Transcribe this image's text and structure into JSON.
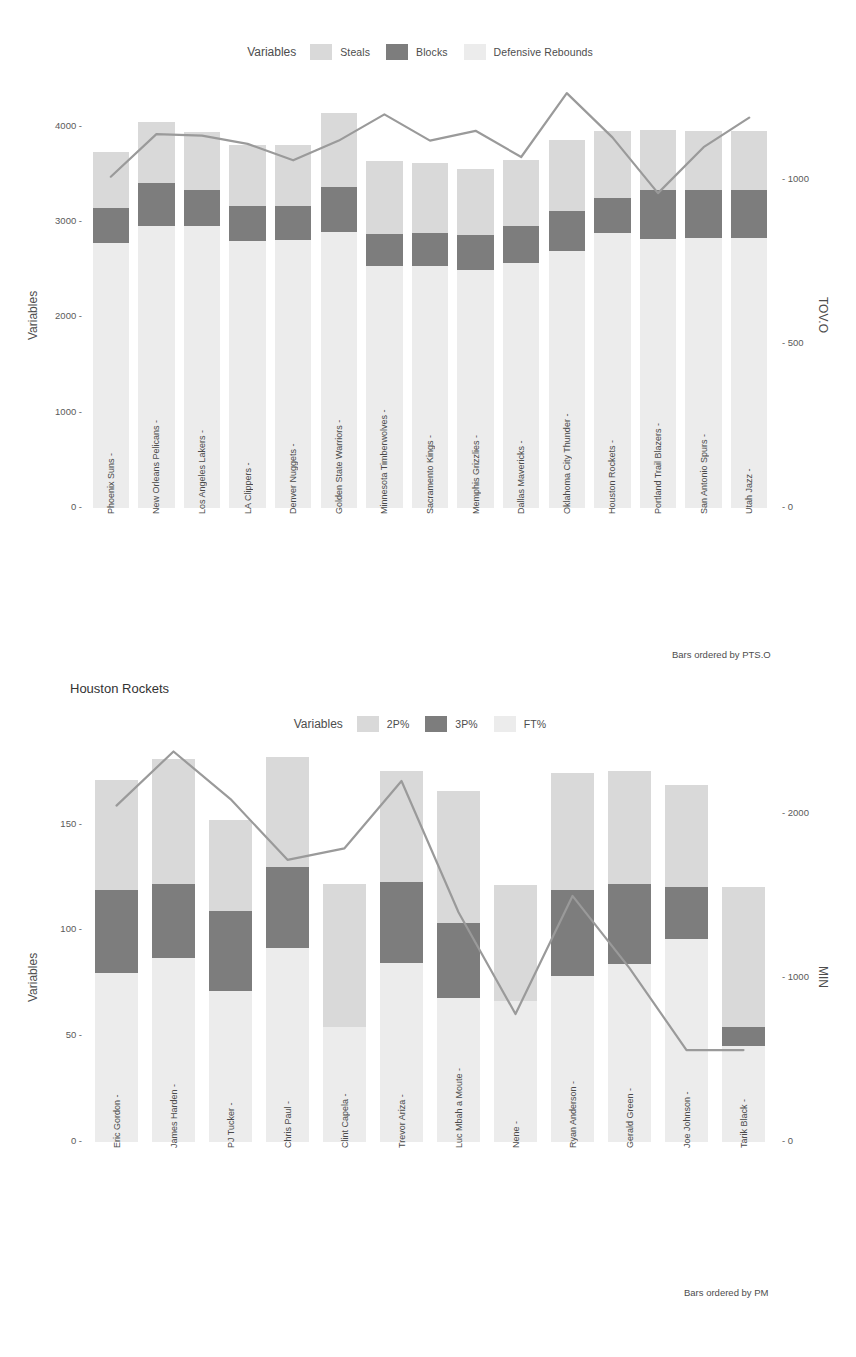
{
  "figure": {
    "background": "#ffffff",
    "colors": {
      "series_light": "#d9d9d9",
      "series_dark": "#7d7d7d",
      "series_pale": "#ececec",
      "line": "#9a9a9a",
      "text": "#4d4d4d"
    }
  },
  "panel1": {
    "legend": {
      "title": "Variables",
      "items": [
        {
          "label": "Steals",
          "color": "#d9d9d9",
          "swatch_name": "legend-swatch-steals"
        },
        {
          "label": "Blocks",
          "color": "#7d7d7d",
          "swatch_name": "legend-swatch-blocks"
        },
        {
          "label": "Defensive Rebounds",
          "color": "#ececec",
          "swatch_name": "legend-swatch-defensive-rebounds"
        }
      ]
    },
    "caption": "Bars ordered by PTS.O",
    "chart_data": {
      "type": "bar",
      "title": "",
      "subtitle": "",
      "xlabel": "",
      "ylabel": "Variables",
      "y2label": "TOV.O",
      "ylim": [
        0,
        4300
      ],
      "y2lim": [
        0,
        1250
      ],
      "yticks": [
        0,
        1000,
        2000,
        3000,
        4000
      ],
      "y2ticks": [
        0,
        500,
        1000
      ],
      "grid": false,
      "legend_position": "top",
      "stacked": true,
      "categories": [
        "Phoenix Suns",
        "New Orleans Pelicans",
        "Los Angeles Lakers",
        "LA Clippers",
        "Denver Nuggets",
        "Golden State Warriors",
        "Minnesota Timberwolves",
        "Sacramento Kings",
        "Memphis Grizzlies",
        "Dallas Mavericks",
        "Oklahoma City Thunder",
        "Houston Rockets",
        "Portland Trail Blazers",
        "San Antonio Spurs",
        "Utah Jazz"
      ],
      "series": [
        {
          "name": "Defensive Rebounds",
          "color": "#ececec",
          "values": [
            2780,
            2960,
            2960,
            2800,
            2810,
            2890,
            2540,
            2540,
            2500,
            2570,
            2700,
            2880,
            2820,
            2830,
            2830
          ]
        },
        {
          "name": "Blocks",
          "color": "#7d7d7d",
          "values": [
            370,
            450,
            370,
            370,
            360,
            480,
            330,
            340,
            360,
            390,
            420,
            370,
            520,
            500,
            500
          ]
        },
        {
          "name": "Steals",
          "color": "#d9d9d9",
          "values": [
            580,
            640,
            610,
            640,
            640,
            770,
            770,
            740,
            700,
            690,
            740,
            700,
            620,
            620,
            620
          ]
        }
      ],
      "overlay_line": {
        "name": "TOV.O",
        "color": "#9a9a9a",
        "axis": "right",
        "values": [
          1010,
          1140,
          1135,
          1110,
          1060,
          1120,
          1200,
          1120,
          1150,
          1070,
          1265,
          1130,
          960,
          1100,
          1190
        ]
      }
    }
  },
  "panel2": {
    "title": "Houston Rockets",
    "legend": {
      "title": "Variables",
      "items": [
        {
          "label": "2P%",
          "color": "#d9d9d9",
          "swatch_name": "legend-swatch-2p"
        },
        {
          "label": "3P%",
          "color": "#7d7d7d",
          "swatch_name": "legend-swatch-3p"
        },
        {
          "label": "FT%",
          "color": "#ececec",
          "swatch_name": "legend-swatch-ft"
        }
      ]
    },
    "caption": "Bars ordered by PM",
    "chart_data": {
      "type": "bar",
      "title": "Houston Rockets",
      "xlabel": "",
      "ylabel": "Variables",
      "y2label": "MIN",
      "ylim": [
        0,
        190
      ],
      "y2lim": [
        0,
        2450
      ],
      "yticks": [
        0,
        50,
        100,
        150
      ],
      "y2ticks": [
        0,
        1000,
        2000
      ],
      "grid": false,
      "legend_position": "top",
      "stacked": true,
      "categories": [
        "Eric Gordon",
        "James Harden",
        "PJ Tucker",
        "Chris Paul",
        "Clint Capela",
        "Trevor Ariza",
        "Luc Mbah a Moute",
        "Nene",
        "Ryan Anderson",
        "Gerald Green",
        "Joe Johnson",
        "Tarik Black"
      ],
      "series": [
        {
          "name": "FT%",
          "color": "#ececec",
          "values": [
            80.0,
            87.0,
            71.5,
            91.5,
            54.5,
            84.5,
            68.0,
            66.5,
            78.5,
            84.0,
            96.0,
            45.5
          ]
        },
        {
          "name": "3P%",
          "color": "#7d7d7d",
          "values": [
            39.0,
            35.0,
            37.5,
            38.5,
            0.0,
            38.5,
            35.5,
            0.0,
            40.5,
            38.0,
            24.5,
            9.0
          ]
        },
        {
          "name": "2P%",
          "color": "#d9d9d9",
          "values": [
            52.0,
            59.0,
            43.0,
            52.0,
            67.5,
            52.5,
            62.5,
            55.0,
            55.5,
            53.5,
            48.0,
            66.0
          ]
        }
      ],
      "overlay_line": {
        "name": "MIN",
        "color": "#9a9a9a",
        "axis": "right",
        "values": [
          2050,
          2380,
          2090,
          1720,
          1790,
          2200,
          1400,
          780,
          1500,
          1060,
          560,
          560
        ]
      }
    }
  }
}
